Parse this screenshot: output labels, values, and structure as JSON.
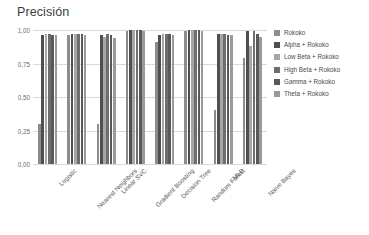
{
  "chart_data": {
    "type": "bar",
    "title": "Precisión",
    "xlabel": "",
    "ylabel": "",
    "ylim": [
      0,
      1.0
    ],
    "ytick_labels": [
      "0,00",
      "0,25",
      "0,50",
      "0,75",
      "1,00"
    ],
    "ytick_values": [
      0.0,
      0.25,
      0.5,
      0.75,
      1.0
    ],
    "grid": true,
    "legend_position": "right",
    "categories": [
      "Logistic",
      "Nearest Neighbors",
      "Linear SVC",
      "Gradient Boosting",
      "Decision Tree",
      "Random Forest",
      "MLP",
      "Naive Bayes"
    ],
    "series": [
      {
        "name": "Rokoko",
        "color": "#8c8c8c",
        "values": [
          0.3,
          0.96,
          0.3,
          0.99,
          0.91,
          0.99,
          0.4,
          0.79
        ]
      },
      {
        "name": "Alpha + Rokoko",
        "color": "#4f4f4f",
        "values": [
          0.96,
          0.97,
          0.96,
          1.0,
          0.96,
          1.0,
          0.97,
          0.99
        ]
      },
      {
        "name": "Low Beta + Rokoko",
        "color": "#a6a6a6",
        "values": [
          0.97,
          0.97,
          0.95,
          1.0,
          0.97,
          1.0,
          0.97,
          0.88
        ]
      },
      {
        "name": "High Beta + Rokoko",
        "color": "#6e6e6e",
        "values": [
          0.97,
          0.97,
          0.97,
          1.0,
          0.97,
          1.0,
          0.97,
          0.99
        ]
      },
      {
        "name": "Gamma + Rokoko",
        "color": "#595959",
        "values": [
          0.96,
          0.97,
          0.96,
          1.0,
          0.97,
          1.0,
          0.96,
          0.97
        ]
      },
      {
        "name": "Theta + Rokoko",
        "color": "#9a9a9a",
        "values": [
          0.96,
          0.96,
          0.94,
          0.99,
          0.96,
          0.99,
          0.96,
          0.95
        ]
      }
    ]
  }
}
